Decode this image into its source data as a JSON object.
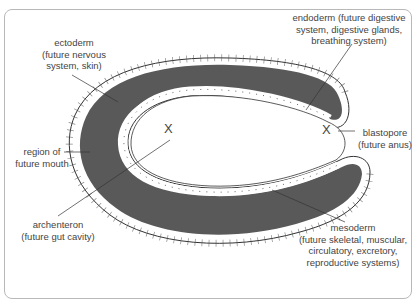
{
  "diagram": {
    "colors": {
      "tissue_fill": "#595959",
      "cell_layer_fill": "#ffffff",
      "outline": "#333333",
      "frame": "#b8b8b8",
      "text": "#444444"
    },
    "labels": {
      "ectoderm": {
        "line1": "ectoderm",
        "line2": "(future nervous",
        "line3": "system, skin)"
      },
      "endoderm": {
        "line1": "endoderm (future digestive",
        "line2": "system, digestive glands,",
        "line3": "breathing system)"
      },
      "mouth": {
        "line1": "region of",
        "line2": "future mouth"
      },
      "blastopore": {
        "line1": "blastopore",
        "line2": "(future anus)"
      },
      "archenteron": {
        "line1": "archenteron",
        "line2": "(future gut cavity)"
      },
      "mesoderm": {
        "line1": "mesoderm",
        "line2": "(future skeletal, muscular,",
        "line3": "circulatory, excretory,",
        "line4": "reproductive systems)"
      }
    },
    "markers": {
      "mouth_x": "X",
      "blastopore_x": "X"
    }
  }
}
